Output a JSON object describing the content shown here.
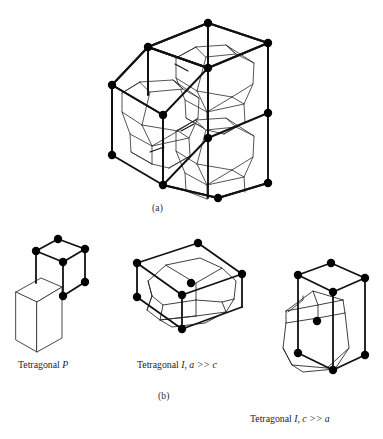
{
  "figure": {
    "background_color": "#ffffff",
    "line_color": "#111111",
    "node_color": "#000000",
    "panels": [
      {
        "id": "a",
        "caption": "(a)",
        "description": "Body-centred tetragonal lattice with truncated-octahedron Wigner-Seitz cells shown in two stacked unit cells"
      },
      {
        "id": "b",
        "caption": "(b)",
        "description": "Three tetragonal lattice types with their Wigner-Seitz cells"
      }
    ],
    "lattice_labels": [
      {
        "id": "tetragonal-p",
        "prefix": "Tetragonal ",
        "symbol": "P",
        "relation": ""
      },
      {
        "id": "tetragonal-i-a",
        "prefix": "Tetragonal ",
        "symbol": "I",
        "relation": ", a >> c"
      },
      {
        "id": "tetragonal-i-c",
        "prefix": "Tetragonal ",
        "symbol": "I",
        "relation": ", c >> a"
      }
    ],
    "label_text": {
      "tetragonal_p": "Tetragonal P",
      "tetragonal_i_a_gg_c": "Tetragonal I, a >> c",
      "tetragonal_i_c_gg_a": "Tetragonal I, c >> a"
    },
    "caption_a": "(a)",
    "caption_b": "(b)"
  }
}
